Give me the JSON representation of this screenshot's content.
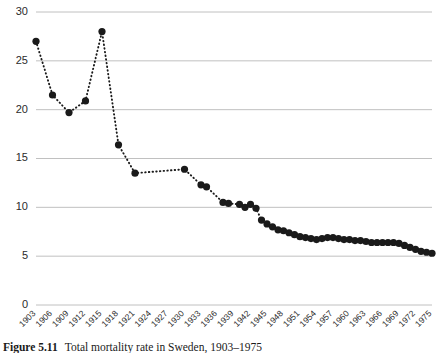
{
  "caption": {
    "label": "Figure 5.11",
    "text": "Total mortality rate in Sweden, 1903–1975"
  },
  "chart_data": {
    "type": "line",
    "title": "",
    "subtitle": "",
    "xlabel": "",
    "ylabel": "",
    "xlim": [
      1903,
      1975
    ],
    "ylim": [
      0,
      30
    ],
    "grid": true,
    "legend": null,
    "marker": "filled-circle",
    "line_style": "dotted",
    "series_color": "#1a1a1a",
    "grid_color": "#b9b9b9",
    "ytick_labels": [
      "0",
      "5",
      "10",
      "15",
      "20",
      "25",
      "30"
    ],
    "ytick_values": [
      0,
      5,
      10,
      15,
      20,
      25,
      30
    ],
    "xtick_labels": [
      "1903",
      "1906",
      "1909",
      "1912",
      "1915",
      "1918",
      "1921",
      "1924",
      "1927",
      "1930",
      "1933",
      "1936",
      "1939",
      "1942",
      "1945",
      "1948",
      "1951",
      "1954",
      "1957",
      "1960",
      "1963",
      "1966",
      "1969",
      "1972",
      "1975"
    ],
    "xtick_values": [
      1903,
      1906,
      1909,
      1912,
      1915,
      1918,
      1921,
      1924,
      1927,
      1930,
      1933,
      1936,
      1939,
      1942,
      1945,
      1948,
      1951,
      1954,
      1957,
      1960,
      1963,
      1966,
      1969,
      1972,
      1975
    ],
    "x": [
      1903,
      1906,
      1909,
      1912,
      1915,
      1918,
      1921,
      1930,
      1933,
      1934,
      1937,
      1938,
      1940,
      1941,
      1942,
      1943,
      1944,
      1945,
      1946,
      1947,
      1948,
      1949,
      1950,
      1951,
      1952,
      1953,
      1954,
      1955,
      1956,
      1957,
      1958,
      1959,
      1960,
      1961,
      1962,
      1963,
      1964,
      1965,
      1966,
      1967,
      1968,
      1969,
      1970,
      1971,
      1972,
      1973,
      1974,
      1975
    ],
    "values": [
      27.0,
      21.5,
      19.7,
      20.9,
      28.0,
      16.4,
      13.5,
      13.9,
      12.3,
      12.1,
      10.5,
      10.4,
      10.3,
      10.0,
      10.3,
      9.9,
      8.7,
      8.3,
      8.0,
      7.7,
      7.6,
      7.4,
      7.2,
      7.0,
      6.9,
      6.8,
      6.7,
      6.8,
      6.9,
      6.9,
      6.8,
      6.7,
      6.7,
      6.6,
      6.6,
      6.5,
      6.4,
      6.4,
      6.4,
      6.4,
      6.4,
      6.3,
      6.1,
      5.9,
      5.7,
      5.5,
      5.4,
      5.3
    ],
    "series": [
      {
        "name": "Total rate",
        "values": [
          27.0,
          21.5,
          19.7,
          20.9,
          28.0,
          16.4,
          13.5,
          13.9,
          12.3,
          12.1,
          10.5,
          10.4,
          10.3,
          10.0,
          10.3,
          9.9,
          8.7,
          8.3,
          8.0,
          7.7,
          7.6,
          7.4,
          7.2,
          7.0,
          6.9,
          6.8,
          6.7,
          6.8,
          6.9,
          6.9,
          6.8,
          6.7,
          6.7,
          6.6,
          6.6,
          6.5,
          6.4,
          6.4,
          6.4,
          6.4,
          6.4,
          6.3,
          6.1,
          5.9,
          5.7,
          5.5,
          5.4,
          5.3
        ]
      }
    ]
  }
}
